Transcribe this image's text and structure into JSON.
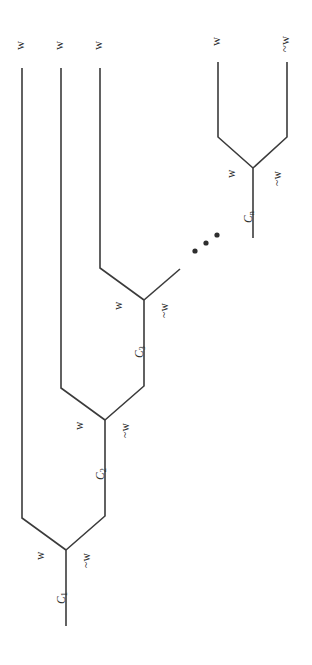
{
  "figure": {
    "orientation": "rotated-90",
    "background_color": "#ffffff",
    "line_color": "#3b3b3b"
  },
  "leaves": [
    {
      "id": "leaf-1",
      "label": "w"
    },
    {
      "id": "leaf-2",
      "label": "w"
    },
    {
      "id": "leaf-3",
      "label": "w"
    },
    {
      "id": "leaf-4",
      "label": "w"
    },
    {
      "id": "leaf-5",
      "label": "~w"
    }
  ],
  "nodes": [
    {
      "id": "node-c1",
      "label": "C",
      "subscript": "1",
      "left_branch": "w",
      "right_branch": "~w"
    },
    {
      "id": "node-c2",
      "label": "C",
      "subscript": "2",
      "left_branch": "w",
      "right_branch": "~w"
    },
    {
      "id": "node-c3",
      "label": "C",
      "subscript": "3",
      "left_branch": "w",
      "right_branch": "~w"
    },
    {
      "id": "node-cn",
      "label": "C",
      "subscript": "n",
      "left_branch": "w",
      "right_branch": "~w"
    }
  ],
  "ellipsis": {
    "id": "ellipsis-dots",
    "label": "...",
    "dot_count": 3
  }
}
